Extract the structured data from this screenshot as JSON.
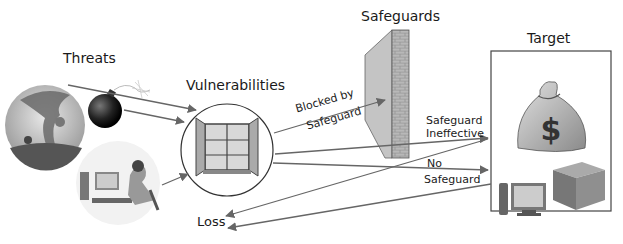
{
  "titles": {
    "threats": "Threats",
    "vulnerabilities": "Vulnerabilities",
    "safeguards": "Safeguards",
    "target": "Target"
  },
  "edges": {
    "blocked_line1": "Blocked by",
    "blocked_line2": "Safeguard",
    "ineffective_line1": "Safeguard",
    "ineffective_line2": "Ineffective",
    "no_line1": "No",
    "no_line2": "Safeguard",
    "loss": "Loss"
  },
  "icons": {
    "threat1": "tornado-icon",
    "threat2": "bomb-icon",
    "threat3": "hacker-icon",
    "vulnerability": "open-window-icon",
    "safeguard": "brick-wall-icon",
    "target1": "money-bag-icon",
    "target2": "computer-icon",
    "target3": "box-icon"
  },
  "colors": {
    "line": "#555555",
    "text": "#1a1a1a"
  }
}
